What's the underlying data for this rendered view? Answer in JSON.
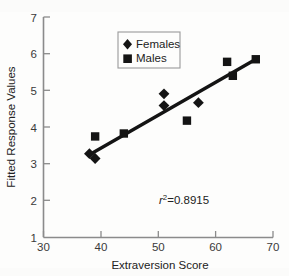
{
  "chart_data": {
    "type": "scatter",
    "title": "",
    "xlabel": "Extraversion Score",
    "ylabel": "Fitted Response Values",
    "xlim": [
      30,
      70
    ],
    "ylim": [
      1,
      7
    ],
    "xticks": [
      30,
      40,
      50,
      60,
      70
    ],
    "yticks": [
      1,
      2,
      3,
      4,
      5,
      6,
      7
    ],
    "grid": false,
    "legend_position": "upper-center",
    "series": [
      {
        "name": "Females",
        "marker": "diamond",
        "color": "#141414",
        "points": [
          {
            "x": 38.0,
            "y": 3.28
          },
          {
            "x": 39.0,
            "y": 3.15
          },
          {
            "x": 51.0,
            "y": 4.91
          },
          {
            "x": 51.0,
            "y": 4.59
          },
          {
            "x": 57.0,
            "y": 4.67
          }
        ]
      },
      {
        "name": "Males",
        "marker": "square",
        "color": "#141414",
        "points": [
          {
            "x": 39.0,
            "y": 3.75
          },
          {
            "x": 44.0,
            "y": 3.83
          },
          {
            "x": 55.0,
            "y": 4.18
          },
          {
            "x": 62.0,
            "y": 5.78
          },
          {
            "x": 63.0,
            "y": 5.4
          },
          {
            "x": 67.0,
            "y": 5.85
          }
        ]
      }
    ],
    "fit_line": {
      "x_start": 38.0,
      "y_start": 3.25,
      "x_end": 67.0,
      "y_end": 5.85
    },
    "annotations": [
      {
        "name": "r-squared",
        "r_symbol": "r",
        "superscript": "2",
        "equals": "=",
        "value": "0.8915",
        "x": 54.0,
        "y": 2.0
      }
    ]
  },
  "legend": {
    "entries": [
      {
        "label": "Females",
        "marker": "diamond"
      },
      {
        "label": "Males",
        "marker": "square"
      }
    ]
  },
  "axes": {
    "x_title": "Extraversion Score",
    "y_title": "Fitted Response Values",
    "x_tick_labels": [
      "30",
      "40",
      "50",
      "60",
      "70"
    ],
    "y_tick_labels": [
      "1",
      "2",
      "3",
      "4",
      "5",
      "6",
      "7"
    ]
  }
}
